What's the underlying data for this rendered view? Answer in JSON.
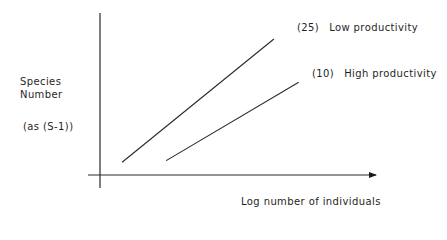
{
  "chart_data": {
    "type": "line",
    "title": "",
    "xlabel": "Log number of individuals",
    "ylabel": "Species Number",
    "ylabel_note": "(as (S-1))",
    "xlim": [
      0,
      1
    ],
    "ylim": [
      0,
      1
    ],
    "grid": false,
    "x_ticks": [],
    "y_ticks": [],
    "legend": "inline-end-labels",
    "series": [
      {
        "name": "Low productivity",
        "tag": "(25)",
        "points": [
          [
            0.08,
            0.08
          ],
          [
            0.63,
            0.85
          ]
        ]
      },
      {
        "name": "High productivity",
        "tag": "(10)",
        "points": [
          [
            0.24,
            0.09
          ],
          [
            0.72,
            0.58
          ]
        ]
      }
    ]
  }
}
